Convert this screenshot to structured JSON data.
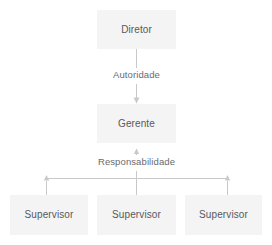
{
  "diagram": {
    "colors": {
      "canvas": "#ffffff",
      "node_fill": "#f4f4f5",
      "node_text": "#58585b",
      "edge_label_text": "#6a6a6d",
      "connector": "#c9c9cc"
    },
    "nodes": {
      "director": {
        "label": "Diretor",
        "level": 1
      },
      "manager": {
        "label": "Gerente",
        "level": 2
      },
      "supervisors": [
        {
          "label": "Supervisor",
          "level": 3,
          "position": "left"
        },
        {
          "label": "Supervisor",
          "level": 3,
          "position": "center"
        },
        {
          "label": "Supervisor",
          "level": 3,
          "position": "right"
        }
      ]
    },
    "edges": {
      "authority": {
        "label": "Autoridade",
        "from": "Diretor",
        "to": "Gerente",
        "direction": "down",
        "arrowhead": "single"
      },
      "responsibility": {
        "label": "Responsabilidade",
        "from": "Supervisor",
        "to": "Gerente",
        "direction": "up",
        "arrowhead": "three-way"
      }
    }
  }
}
